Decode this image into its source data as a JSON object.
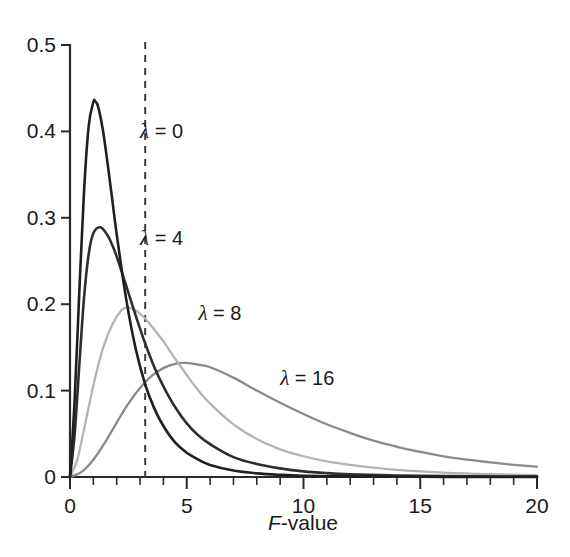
{
  "chart_data": {
    "type": "line",
    "title": "",
    "subtitle": "",
    "xlabel": "F-value",
    "ylabel": "",
    "xlim": [
      0,
      20
    ],
    "ylim": [
      0,
      0.5
    ],
    "grid": false,
    "legend_position": "inline-annotations",
    "x_ticks_major": [
      0,
      5,
      10,
      15,
      20
    ],
    "x_tick_labels": [
      "0",
      "5",
      "10",
      "15",
      "20"
    ],
    "x_ticks_minor": [
      1,
      2,
      3,
      4,
      6,
      7,
      8,
      9,
      11,
      12,
      13,
      14,
      16,
      17,
      18,
      19
    ],
    "y_ticks_major": [
      0,
      0.1,
      0.2,
      0.3,
      0.4,
      0.5
    ],
    "y_tick_labels": [
      "0",
      "0.1",
      "0.2",
      "0.3",
      "0.4",
      "0.5"
    ],
    "annotations": [
      {
        "text": "λ = 0",
        "x": 3.0,
        "y": 0.392,
        "series": "lambda-0"
      },
      {
        "text": "λ = 4",
        "x": 3.0,
        "y": 0.268,
        "series": "lambda-4"
      },
      {
        "text": "λ = 8",
        "x": 5.5,
        "y": 0.182,
        "series": "lambda-8"
      },
      {
        "text": "λ = 16",
        "x": 9.0,
        "y": 0.107,
        "series": "lambda-16"
      }
    ],
    "reference_lines": [
      {
        "orientation": "vertical",
        "x": 3.22,
        "style": "dashed",
        "label": "critical F-value",
        "color": "#3d3d3d"
      }
    ],
    "series": [
      {
        "name": "λ = 0",
        "id": "lambda-0",
        "color": "#1f1f1f",
        "peak_x": 1.07,
        "peak_y": 0.435,
        "x": [
          0,
          0.2,
          0.4,
          0.6,
          0.8,
          1.0,
          1.07,
          1.2,
          1.4,
          1.6,
          1.8,
          2.0,
          2.4,
          2.8,
          3.2,
          3.6,
          4.0,
          4.5,
          5.0,
          5.5,
          6.0,
          7.0,
          8.0,
          9.0,
          10.0,
          12.0,
          14.0,
          16.0,
          18.0,
          20.0
        ],
        "y": [
          0,
          0.09,
          0.215,
          0.33,
          0.406,
          0.434,
          0.435,
          0.429,
          0.403,
          0.365,
          0.323,
          0.281,
          0.207,
          0.15,
          0.109,
          0.08,
          0.059,
          0.04,
          0.028,
          0.02,
          0.014,
          0.0075,
          0.0042,
          0.0025,
          0.0015,
          0.0007,
          0.0003,
          0.0002,
          0.0001,
          0.0001
        ]
      },
      {
        "name": "λ = 4",
        "id": "lambda-4",
        "color": "#2e2e2e",
        "peak_x": 1.3,
        "peak_y": 0.289,
        "x": [
          0,
          0.2,
          0.4,
          0.6,
          0.8,
          1.0,
          1.3,
          1.6,
          1.8,
          2.0,
          2.4,
          2.8,
          3.2,
          3.6,
          4.0,
          4.5,
          5.0,
          5.5,
          6.0,
          7.0,
          8.0,
          9.0,
          10.0,
          11.0,
          12.0,
          14.0,
          16.0,
          18.0,
          20.0
        ],
        "y": [
          0,
          0.05,
          0.13,
          0.207,
          0.258,
          0.282,
          0.289,
          0.28,
          0.269,
          0.255,
          0.222,
          0.188,
          0.156,
          0.128,
          0.105,
          0.081,
          0.062,
          0.048,
          0.038,
          0.023,
          0.015,
          0.01,
          0.0065,
          0.0045,
          0.0032,
          0.0017,
          0.001,
          0.0006,
          0.0004
        ]
      },
      {
        "name": "λ = 8",
        "id": "lambda-8",
        "color": "#b3b3b3",
        "peak_x": 2.45,
        "peak_y": 0.196,
        "x": [
          0,
          0.3,
          0.6,
          1.0,
          1.4,
          1.8,
          2.2,
          2.45,
          2.8,
          3.2,
          3.6,
          4.0,
          4.5,
          5.0,
          5.5,
          6.0,
          7.0,
          8.0,
          9.0,
          10.0,
          11.0,
          12.0,
          14.0,
          16.0,
          18.0,
          20.0
        ],
        "y": [
          0,
          0.019,
          0.055,
          0.106,
          0.148,
          0.176,
          0.193,
          0.196,
          0.193,
          0.184,
          0.171,
          0.157,
          0.137,
          0.118,
          0.1,
          0.085,
          0.061,
          0.044,
          0.032,
          0.024,
          0.018,
          0.014,
          0.0082,
          0.005,
          0.0032,
          0.0022
        ]
      },
      {
        "name": "λ = 16",
        "id": "lambda-16",
        "color": "#8a8a8a",
        "peak_x": 4.95,
        "peak_y": 0.132,
        "x": [
          0,
          0.5,
          1.0,
          1.5,
          2.0,
          2.5,
          3.0,
          3.5,
          4.0,
          4.5,
          4.95,
          5.5,
          6.0,
          7.0,
          8.0,
          9.0,
          10.0,
          11.0,
          12.0,
          13.0,
          14.0,
          15.0,
          16.0,
          17.0,
          18.0,
          19.0,
          20.0
        ],
        "y": [
          0,
          0.006,
          0.02,
          0.04,
          0.063,
          0.085,
          0.103,
          0.117,
          0.126,
          0.131,
          0.132,
          0.13,
          0.127,
          0.115,
          0.1,
          0.086,
          0.073,
          0.061,
          0.051,
          0.042,
          0.035,
          0.029,
          0.024,
          0.02,
          0.017,
          0.014,
          0.012
        ]
      }
    ]
  },
  "axes": {
    "x_axis_name": "F-value axis",
    "y_axis_name": "density axis",
    "x_label_prefix_italic": "F",
    "x_label_suffix": "-value"
  },
  "colors": {
    "axis": "#2b2b2b",
    "text": "#1a1a1a",
    "background": "#ffffff",
    "critical_line": "#3d3d3d"
  }
}
